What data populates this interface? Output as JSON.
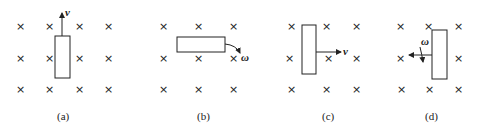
{
  "figure": {
    "panels": [
      {
        "caption": "(a)",
        "label": "v",
        "motion": "translation upward"
      },
      {
        "caption": "(b)",
        "label": "ω",
        "motion": "rotation about left end"
      },
      {
        "caption": "(c)",
        "label": "v",
        "motion": "translation right"
      },
      {
        "caption": "(d)",
        "label": "ω",
        "motion": "rotation about axis"
      }
    ],
    "field_symbol": "×"
  }
}
